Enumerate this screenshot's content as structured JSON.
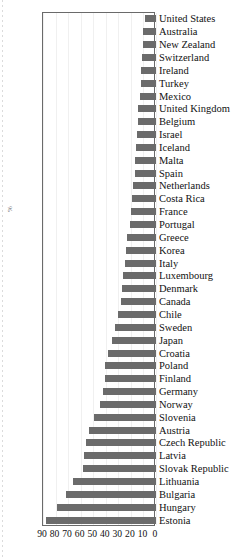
{
  "chart_data": {
    "type": "bar",
    "orientation": "horizontal",
    "title": "",
    "subtitle": "",
    "xlabel": "",
    "ylabel": "%",
    "xlim": [
      90,
      0
    ],
    "x_axis_reversed": true,
    "grid": true,
    "legend": null,
    "xticks": [
      90,
      80,
      70,
      60,
      50,
      40,
      30,
      20,
      10,
      0
    ],
    "xtick_labels": [
      "90",
      "80",
      "70",
      "60",
      "50",
      "40",
      "30",
      "20",
      "10",
      "0"
    ],
    "bar_color": "#6b6b6b",
    "categories": [
      "United States",
      "Australia",
      "New Zealand",
      "Switzerland",
      "Ireland",
      "Turkey",
      "Mexico",
      "United Kingdom",
      "Belgium",
      "Israel",
      "Iceland",
      "Malta",
      "Spain",
      "Netherlands",
      "Costa Rica",
      "France",
      "Portugal",
      "Greece",
      "Korea",
      "Italy",
      "Luxembourg",
      "Denmark",
      "Canada",
      "Chile",
      "Sweden",
      "Japan",
      "Croatia",
      "Poland",
      "Finland",
      "Germany",
      "Norway",
      "Slovenia",
      "Austria",
      "Czech Republic",
      "Latvia",
      "Slovak Republic",
      "Lithuania",
      "Bulgaria",
      "Hungary",
      "Estonia"
    ],
    "values": [
      9,
      10,
      10,
      11,
      12,
      12,
      13,
      14,
      14,
      15,
      16,
      17,
      17,
      18,
      19,
      20,
      21,
      23,
      24,
      25,
      26,
      27,
      28,
      30,
      33,
      35,
      38,
      41,
      41,
      42,
      45,
      49,
      53,
      56,
      57,
      58,
      66,
      72,
      79,
      88
    ]
  }
}
